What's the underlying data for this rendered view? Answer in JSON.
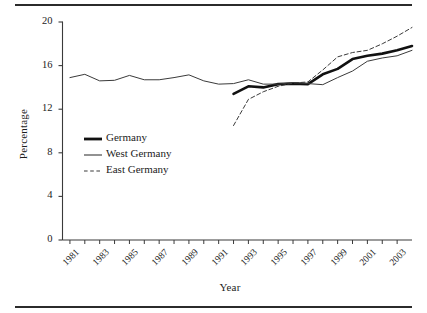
{
  "figure": {
    "top_rule": "horizontal-rule",
    "bottom_rule": "horizontal-rule"
  },
  "chart_data": {
    "type": "line",
    "title": "",
    "xlabel": "Year",
    "ylabel": "Percentage",
    "xlim": [
      1980.5,
      2004
    ],
    "ylim": [
      0,
      20
    ],
    "yticks": [
      0,
      4,
      8,
      12,
      16,
      20
    ],
    "ytick_labels": [
      "0",
      "4",
      "8",
      "12",
      "16",
      "20"
    ],
    "xticks": [
      1981,
      1983,
      1985,
      1987,
      1989,
      1991,
      1993,
      1995,
      1997,
      1999,
      2001,
      2003
    ],
    "xtick_labels": [
      "1981",
      "1983",
      "1985",
      "1987",
      "1989",
      "1991",
      "1993",
      "1995",
      "1997",
      "1999",
      "2001",
      "2003"
    ],
    "xtick_minor": [
      1982,
      1984,
      1986,
      1988,
      1990,
      1992,
      1994,
      1996,
      1998,
      2000,
      2002
    ],
    "grid": false,
    "legend_position": "center-left",
    "series": [
      {
        "name": "Germany",
        "style": "solid",
        "width": 2.6,
        "color": "#111111",
        "x": [
          1992,
          1993,
          1994,
          1995,
          1996,
          1997,
          1998,
          1999,
          2000,
          2001,
          2002,
          2003,
          2004
        ],
        "values": [
          13.4,
          14.1,
          14.0,
          14.3,
          14.35,
          14.3,
          15.2,
          15.7,
          16.6,
          16.9,
          17.1,
          17.4,
          17.8
        ]
      },
      {
        "name": "West Germany",
        "style": "solid",
        "width": 1.0,
        "color": "#3a3a3a",
        "x": [
          1981,
          1982,
          1983,
          1984,
          1985,
          1986,
          1987,
          1988,
          1989,
          1990,
          1991,
          1992,
          1993,
          1994,
          1995,
          1996,
          1997,
          1998,
          1999,
          2000,
          2001,
          2002,
          2003,
          2004
        ],
        "values": [
          14.9,
          15.2,
          14.6,
          14.65,
          15.1,
          14.7,
          14.7,
          14.9,
          15.15,
          14.6,
          14.3,
          14.35,
          14.7,
          14.3,
          14.3,
          14.45,
          14.35,
          14.25,
          14.9,
          15.5,
          16.4,
          16.7,
          16.9,
          17.4
        ]
      },
      {
        "name": "East Germany",
        "style": "dashed",
        "width": 1.0,
        "color": "#3a3a3a",
        "x": [
          1992,
          1993,
          1994,
          1995,
          1996,
          1997,
          1998,
          1999,
          2000,
          2001,
          2002,
          2003,
          2004
        ],
        "values": [
          10.5,
          12.9,
          13.6,
          14.1,
          14.4,
          14.5,
          15.6,
          16.8,
          17.2,
          17.4,
          18.0,
          18.7,
          19.5
        ]
      }
    ]
  },
  "legend": {
    "items": [
      {
        "label": "Germany",
        "style": "solid-thick"
      },
      {
        "label": "West Germany",
        "style": "solid-thin"
      },
      {
        "label": "East Germany",
        "style": "dashed-thin"
      }
    ]
  }
}
